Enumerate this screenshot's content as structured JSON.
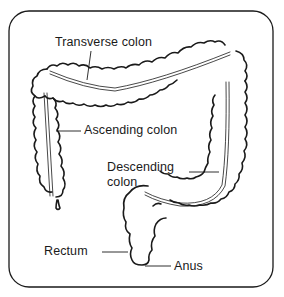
{
  "diagram": {
    "labels": {
      "transverse": "Transverse colon",
      "ascending": "Ascending colon",
      "descending_line1": "Descending",
      "descending_line2": "colon",
      "rectum": "Rectum",
      "anus": "Anus"
    },
    "colors": {
      "stroke": "#1a1a1a",
      "background": "#ffffff"
    }
  }
}
